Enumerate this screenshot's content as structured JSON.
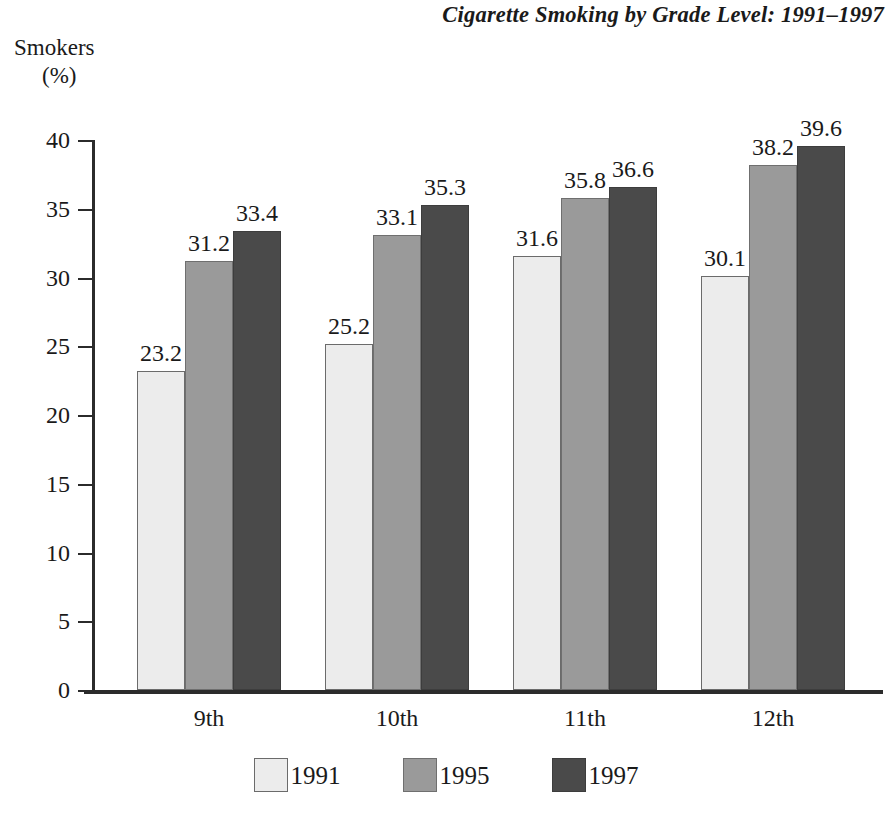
{
  "chart_data": {
    "type": "bar",
    "title": "Cigarette Smoking by Grade Level: 1991–1997",
    "xlabel": "",
    "ylabel": "Smokers",
    "ylabel_unit": "(%)",
    "categories": [
      "9th",
      "10th",
      "11th",
      "12th"
    ],
    "series": [
      {
        "name": "1991",
        "color": "#ececec",
        "values": [
          23.2,
          25.2,
          31.6,
          30.1
        ]
      },
      {
        "name": "1995",
        "color": "#9a9a9a",
        "values": [
          31.2,
          33.1,
          35.8,
          38.2
        ]
      },
      {
        "name": "1997",
        "color": "#4a4a4a",
        "values": [
          33.4,
          35.3,
          36.6,
          39.6
        ]
      }
    ],
    "value_labels": [
      [
        "23.2",
        "31.2",
        "33.4"
      ],
      [
        "25.2",
        "33.1",
        "35.3"
      ],
      [
        "31.6",
        "35.8",
        "36.6"
      ],
      [
        "30.1",
        "38.2",
        "39.6"
      ]
    ],
    "ylim": [
      0,
      40
    ],
    "ytick_values": [
      0,
      5,
      10,
      15,
      20,
      25,
      30,
      35,
      40
    ],
    "ytick_labels": [
      "0",
      "5",
      "10",
      "15",
      "20",
      "25",
      "30",
      "35",
      "40"
    ],
    "grid": false,
    "legend_position": "bottom",
    "legend_entries": [
      "1991",
      "1995",
      "1997"
    ]
  }
}
